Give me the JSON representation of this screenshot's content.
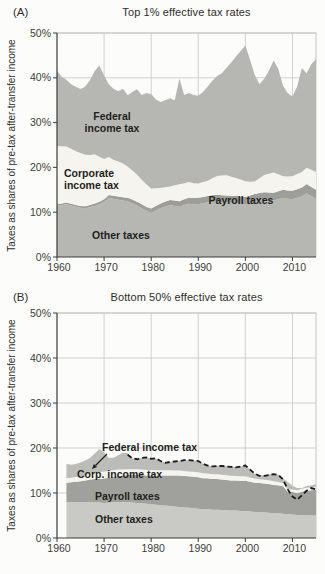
{
  "page": {
    "panel_a_label": "(A)",
    "panel_b_label": "(B)"
  },
  "colors": {
    "background": "#fcfcfa",
    "grid": "#cccccc",
    "frame_light": "#c4c4c1",
    "axis": "#3a3a36",
    "text": "#2e2e2c",
    "tick_text": "#3c3c38",
    "dashed_line": "#1b1b19"
  },
  "chart_data": [
    {
      "id": "top-1-percent",
      "type": "area",
      "stacked": true,
      "title": "Top 1% effective tax rates",
      "panel_label": "(A)",
      "ylabel": "Taxes as shares of pre-tax after-transfer income",
      "ylim": [
        0,
        50
      ],
      "xlim": [
        1960,
        2015
      ],
      "ytick_values": [
        0,
        10,
        20,
        30,
        40,
        50
      ],
      "ytick_labels": [
        "0%",
        "10%",
        "20%",
        "30%",
        "40%",
        "50%"
      ],
      "xtick_values": [
        1960,
        1970,
        1980,
        1990,
        2000,
        2010
      ],
      "xtick_labels": [
        "1960",
        "1970",
        "1980",
        "1990",
        "2000",
        "2010"
      ],
      "grid": true,
      "legend_position": "labels-inside-areas",
      "year_start": 1960,
      "year_end": 2015,
      "series": [
        {
          "name": "Other taxes",
          "color": "#b6b6b3",
          "values": [
            11.5,
            11.6,
            11.8,
            11.5,
            11.2,
            11.0,
            10.9,
            11.1,
            11.4,
            11.8,
            12.3,
            13.2,
            13.0,
            12.8,
            12.6,
            12.4,
            12.0,
            11.5,
            10.9,
            10.3,
            9.9,
            10.4,
            10.9,
            11.3,
            11.6,
            11.4,
            11.2,
            11.6,
            11.9,
            11.8,
            11.8,
            12.0,
            12.2,
            12.3,
            12.4,
            12.3,
            12.2,
            12.1,
            12.1,
            11.9,
            11.8,
            12.1,
            12.4,
            12.6,
            12.8,
            12.7,
            12.6,
            12.9,
            13.2,
            13.0,
            12.9,
            13.2,
            13.5,
            14.2,
            13.6,
            13.0
          ]
        },
        {
          "name": "Payroll taxes",
          "color": "#9d9d9a",
          "values": [
            0.3,
            0.32,
            0.34,
            0.36,
            0.38,
            0.4,
            0.44,
            0.48,
            0.52,
            0.56,
            0.6,
            0.64,
            0.68,
            0.72,
            0.76,
            0.8,
            0.82,
            0.84,
            0.86,
            0.88,
            0.9,
            0.96,
            1.02,
            1.08,
            1.14,
            1.2,
            1.24,
            1.28,
            1.32,
            1.36,
            1.4,
            1.42,
            1.44,
            1.46,
            1.48,
            1.5,
            1.52,
            1.54,
            1.56,
            1.58,
            1.6,
            1.62,
            1.64,
            1.66,
            1.68,
            1.7,
            1.74,
            1.78,
            1.82,
            1.86,
            1.9,
            1.95,
            2.0,
            2.1,
            2.05,
            2.0
          ]
        },
        {
          "name": "Corporate income tax",
          "color": "#f5f4ee",
          "values": [
            13.0,
            12.8,
            12.5,
            12.3,
            12.0,
            11.8,
            11.5,
            11.2,
            11.0,
            10.0,
            9.0,
            8.5,
            8.0,
            7.8,
            7.5,
            7.0,
            6.5,
            6.0,
            5.5,
            5.0,
            4.5,
            4.0,
            3.5,
            3.2,
            3.0,
            3.4,
            3.8,
            3.6,
            3.5,
            3.3,
            3.2,
            3.3,
            3.4,
            3.8,
            4.2,
            4.4,
            4.5,
            4.3,
            4.0,
            3.8,
            3.5,
            3.1,
            2.8,
            3.3,
            3.8,
            4.2,
            4.5,
            3.8,
            3.0,
            3.1,
            3.2,
            3.4,
            3.5,
            3.6,
            3.8,
            4.0
          ]
        },
        {
          "name": "Federal income tax",
          "color": "#b6b6b3",
          "values": [
            16.7,
            15.5,
            14.9,
            14.4,
            14.4,
            14.3,
            15.2,
            16.7,
            18.6,
            20.4,
            18.6,
            16.2,
            15.9,
            15.7,
            16.7,
            15.9,
            17.5,
            19.1,
            18.9,
            20.4,
            21.1,
            19.8,
            19.2,
            19.4,
            19.7,
            19.0,
            23.6,
            19.7,
            19.9,
            19.7,
            19.6,
            20.1,
            21.0,
            21.8,
            22.3,
            22.8,
            24.0,
            25.5,
            27.1,
            28.7,
            30.3,
            27.2,
            23.8,
            21.0,
            21.5,
            23.0,
            25.0,
            23.5,
            20.2,
            18.6,
            17.8,
            19.5,
            23.2,
            21.1,
            23.6,
            25.2
          ]
        }
      ],
      "area_labels": {
        "federal": "Federal\nincome tax",
        "corporate": "Corporate\nincome tax",
        "payroll": "Payroll taxes",
        "other": "Other taxes"
      }
    },
    {
      "id": "bottom-50-percent",
      "type": "area",
      "stacked": true,
      "title": "Bottom 50% effective tax rates",
      "panel_label": "(B)",
      "ylabel": "Taxes as shares of pre-tax after-transfer income",
      "ylim": [
        0,
        50
      ],
      "xlim": [
        1960,
        2015
      ],
      "ytick_values": [
        0,
        10,
        20,
        30,
        40,
        50
      ],
      "ytick_labels": [
        "0%",
        "10%",
        "20%",
        "30%",
        "40%",
        "50%"
      ],
      "xtick_values": [
        1960,
        1970,
        1980,
        1990,
        2000,
        2010
      ],
      "xtick_labels": [
        "1960",
        "1970",
        "1980",
        "1990",
        "2000",
        "2010"
      ],
      "grid": true,
      "legend_position": "labels-inside-areas",
      "year_start": 1962,
      "year_end": 2015,
      "series": [
        {
          "name": "Other taxes",
          "color": "#c9c9c5",
          "values": [
            8.0,
            8.0,
            8.0,
            8.0,
            8.0,
            8.0,
            8.0,
            7.9,
            7.8,
            7.9,
            8.0,
            8.0,
            8.0,
            8.0,
            7.9,
            7.8,
            7.7,
            7.6,
            7.5,
            7.4,
            7.3,
            7.2,
            7.1,
            7.0,
            6.9,
            6.8,
            6.7,
            6.6,
            6.5,
            6.4,
            6.4,
            6.3,
            6.3,
            6.2,
            6.2,
            6.1,
            6.1,
            6.0,
            6.0,
            5.9,
            5.8,
            5.7,
            5.7,
            5.6,
            5.5,
            5.5,
            5.4,
            5.3,
            5.2,
            5.1,
            5.1,
            5.0,
            5.0,
            5.0
          ]
        },
        {
          "name": "Payroll taxes",
          "color": "#a0a09d",
          "values": [
            4.3,
            4.4,
            4.5,
            4.6,
            4.8,
            5.0,
            5.1,
            5.2,
            5.4,
            5.5,
            5.6,
            5.8,
            5.9,
            6.0,
            6.1,
            6.2,
            6.3,
            6.3,
            6.4,
            6.5,
            6.6,
            6.7,
            6.8,
            6.9,
            7.0,
            7.0,
            7.0,
            7.0,
            7.0,
            6.9,
            6.9,
            6.8,
            6.8,
            6.8,
            6.7,
            6.7,
            6.7,
            6.7,
            6.7,
            6.6,
            6.5,
            6.5,
            6.4,
            6.4,
            6.3,
            6.2,
            6.1,
            4.9,
            5.0,
            4.9,
            5.2,
            5.5,
            5.6,
            5.7
          ]
        },
        {
          "name": "Corp. income tax",
          "color": "#f5f4ee",
          "values": [
            1.0,
            1.0,
            1.05,
            1.1,
            1.2,
            1.3,
            1.4,
            1.5,
            1.6,
            1.5,
            1.45,
            1.4,
            1.35,
            1.3,
            1.28,
            1.26,
            1.24,
            1.22,
            1.2,
            1.18,
            1.16,
            1.14,
            1.13,
            1.12,
            1.11,
            1.1,
            1.1,
            1.1,
            1.1,
            1.08,
            1.06,
            1.05,
            1.04,
            1.03,
            1.02,
            1.01,
            1.0,
            1.0,
            1.0,
            0.95,
            0.9,
            0.85,
            0.85,
            0.85,
            0.8,
            0.75,
            0.7,
            0.65,
            0.6,
            0.6,
            0.62,
            0.65,
            0.68,
            0.7
          ]
        },
        {
          "name": "Federal income tax",
          "color": "#bcbcb9",
          "values": [
            3.2,
            2.9,
            2.9,
            3.1,
            3.2,
            3.5,
            4.3,
            5.2,
            4.2,
            2.9,
            2.8,
            3.2,
            3.7,
            3.6,
            2.4,
            2.2,
            2.6,
            2.8,
            2.5,
            2.6,
            2.0,
            1.7,
            1.9,
            2.0,
            2.1,
            2.4,
            2.5,
            2.5,
            2.5,
            2.1,
            1.7,
            1.8,
            1.9,
            2.0,
            2.0,
            2.0,
            1.9,
            2.2,
            2.4,
            1.8,
            1.1,
            0.9,
            1.0,
            1.3,
            1.6,
            1.6,
            1.0,
            1.6,
            0.8,
            0.5,
            0.2,
            0.4,
            0.4,
            0.6
          ]
        }
      ],
      "dashed_line": {
        "style": "dashed",
        "color": "#1b1b19",
        "year_start": 1975,
        "year_end": 2015,
        "values": [
          18.5,
          17.7,
          17.5,
          17.8,
          17.9,
          17.6,
          17.7,
          17.1,
          16.7,
          16.9,
          17.0,
          17.1,
          17.3,
          17.3,
          17.2,
          17.1,
          16.5,
          16.1,
          15.9,
          16.0,
          16.0,
          15.9,
          15.8,
          15.7,
          15.9,
          16.1,
          15.2,
          14.3,
          13.8,
          13.8,
          14.0,
          14.2,
          14.0,
          13.0,
          10.8,
          9.2,
          8.5,
          9.5,
          10.5,
          11.1,
          10.8
        ]
      },
      "area_labels": {
        "federal": "Federal income tax",
        "corporate": "Corp. income tax",
        "payroll": "Payroll taxes",
        "other": "Other taxes"
      }
    }
  ]
}
